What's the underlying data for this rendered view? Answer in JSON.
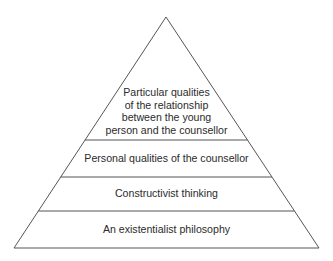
{
  "diagram": {
    "type": "pyramid",
    "line_color": "#555555",
    "text_color": "#2b2b2b",
    "apex": [
      166,
      17
    ],
    "base_left": [
      14,
      248
    ],
    "base_right": [
      319,
      248
    ],
    "tiers": [
      {
        "level": 1,
        "position": "top",
        "lines": [
          "Particular qualities",
          "of the relationship",
          "between the young",
          "person and the counsellor"
        ]
      },
      {
        "level": 2,
        "position": "second",
        "lines": [
          "Personal qualities of the counsellor"
        ]
      },
      {
        "level": 3,
        "position": "third",
        "lines": [
          "Constructivist thinking"
        ]
      },
      {
        "level": 4,
        "position": "base",
        "lines": [
          "An existentialist philosophy"
        ]
      }
    ]
  }
}
